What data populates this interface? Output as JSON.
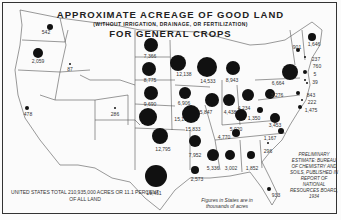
{
  "title": {
    "line1": "APPROXIMATE ACREAGE OF GOOD LAND",
    "line2": "(WITHOUT IRRIGATION, DRAINAGE, OR FERTILIZATION)",
    "line3": "FOR GENERAL CROPS"
  },
  "notes": {
    "total": "UNITED STATES TOTAL 210,935,000 ACRES OR 11.1 PERCENT OF ALL LAND",
    "units": "Figures in States are in thousands of acres",
    "source": "PRELIMINARY ESTIMATE: BUREAU OF CHEMISTRY AND SOILS, PUBLISHED IN REPORT OF NATIONAL RESOURCES BOARD, 1934"
  },
  "states": [
    {
      "name": "Washington",
      "value": "542",
      "x": 50,
      "y": 27,
      "r": 3,
      "lx": 46,
      "ly": 30
    },
    {
      "name": "Oregon",
      "value": "2,059",
      "x": 38,
      "y": 53,
      "r": 5,
      "lx": 38,
      "ly": 59
    },
    {
      "name": "Idaho",
      "value": "87",
      "x": 70,
      "y": 64,
      "r": 1,
      "lx": 70,
      "ly": 67
    },
    {
      "name": "California",
      "value": "478",
      "x": 27,
      "y": 108,
      "r": 2,
      "lx": 28,
      "ly": 112
    },
    {
      "name": "Colorado",
      "value": "286",
      "x": 115,
      "y": 108,
      "r": 1,
      "lx": 115,
      "ly": 112
    },
    {
      "name": "North Dakota",
      "value": "7,366",
      "x": 151,
      "y": 45,
      "r": 7,
      "lx": 150,
      "ly": 54
    },
    {
      "name": "South Dakota",
      "value": "8,775",
      "x": 149,
      "y": 69,
      "r": 7,
      "lx": 150,
      "ly": 78
    },
    {
      "name": "Nebraska",
      "value": "9,690",
      "x": 151,
      "y": 93,
      "r": 7,
      "lx": 150,
      "ly": 102
    },
    {
      "name": "Kansas",
      "value": "15,172",
      "x": 148,
      "y": 117,
      "r": 9,
      "lx": 182,
      "ly": 117
    },
    {
      "name": "Oklahoma",
      "value": "12,795",
      "x": 160,
      "y": 136,
      "r": 8,
      "lx": 163,
      "ly": 147
    },
    {
      "name": "Texas",
      "value": "19,461",
      "x": 156,
      "y": 176,
      "r": 11,
      "lx": 154,
      "ly": 191
    },
    {
      "name": "Minnesota",
      "value": "12,138",
      "x": 178,
      "y": 63,
      "r": 8,
      "lx": 184,
      "ly": 72
    },
    {
      "name": "Wisconsin",
      "value": "14,533",
      "x": 207,
      "y": 67,
      "r": 10,
      "lx": 208,
      "ly": 79
    },
    {
      "name": "Iowa",
      "value": "6,906",
      "x": 185,
      "y": 93,
      "r": 6,
      "lx": 184,
      "ly": 101
    },
    {
      "name": "Missouri",
      "value": "15,833",
      "x": 191,
      "y": 114,
      "r": 9,
      "lx": 193,
      "ly": 127
    },
    {
      "name": "Arkansas",
      "value": "7,952",
      "x": 195,
      "y": 141,
      "r": 6,
      "lx": 195,
      "ly": 153
    },
    {
      "name": "Louisiana",
      "value": "2,573",
      "x": 195,
      "y": 170,
      "r": 4,
      "lx": 197,
      "ly": 177
    },
    {
      "name": "Michigan",
      "value": "8,943",
      "x": 233,
      "y": 68,
      "r": 7,
      "lx": 232,
      "ly": 78
    },
    {
      "name": "Illinois",
      "value": "5,847",
      "x": 212,
      "y": 100,
      "r": 7,
      "lx": 206,
      "ly": 110
    },
    {
      "name": "Indiana",
      "value": "4,438",
      "x": 229,
      "y": 100,
      "r": 6,
      "lx": 230,
      "ly": 110
    },
    {
      "name": "Ohio",
      "value": "4,234",
      "x": 248,
      "y": 95,
      "r": 6,
      "lx": 244,
      "ly": 106
    },
    {
      "name": "Kentucky",
      "value": "5,020",
      "x": 241,
      "y": 115,
      "r": 6,
      "lx": 236,
      "ly": 127
    },
    {
      "name": "Tennessee",
      "value": "4,770",
      "x": 236,
      "y": 133,
      "r": 4,
      "lx": 224,
      "ly": 135
    },
    {
      "name": "Mississippi",
      "value": "5,336",
      "x": 213,
      "y": 155,
      "r": 6,
      "lx": 213,
      "ly": 166
    },
    {
      "name": "Alabama",
      "value": "3,002",
      "x": 230,
      "y": 155,
      "r": 5,
      "lx": 231,
      "ly": 166
    },
    {
      "name": "Georgia",
      "value": "1,852",
      "x": 251,
      "y": 155,
      "r": 4,
      "lx": 252,
      "ly": 166
    },
    {
      "name": "South Carolina",
      "value": "296",
      "x": 268,
      "y": 143,
      "r": 1,
      "lx": 268,
      "ly": 149
    },
    {
      "name": "North Carolina",
      "value": "1,167",
      "x": 281,
      "y": 131,
      "r": 3,
      "lx": 270,
      "ly": 136
    },
    {
      "name": "Florida",
      "value": "933",
      "x": 269,
      "y": 189,
      "r": 2,
      "lx": 276,
      "ly": 193
    },
    {
      "name": "West Virginia",
      "value": "1,350",
      "x": 260,
      "y": 110,
      "r": 3,
      "lx": 254,
      "ly": 116
    },
    {
      "name": "Virginia",
      "value": "3,453",
      "x": 275,
      "y": 118,
      "r": 5,
      "lx": 275,
      "ly": 123
    },
    {
      "name": "Pennsylvania",
      "value": "3,276",
      "x": 270,
      "y": 94,
      "r": 5,
      "lx": 277,
      "ly": 93
    },
    {
      "name": "New York",
      "value": "6,664",
      "x": 290,
      "y": 72,
      "r": 8,
      "lx": 278,
      "ly": 81
    },
    {
      "name": "Maryland",
      "value": "843",
      "x": 298,
      "y": 93,
      "r": 2,
      "lx": 311,
      "ly": 93
    },
    {
      "name": "Delaware",
      "value": "222",
      "x": 302,
      "y": 100,
      "r": 1,
      "lx": 312,
      "ly": 100
    },
    {
      "name": "New Jersey",
      "value": "1,475",
      "x": 300,
      "y": 107,
      "r": 2,
      "lx": 311,
      "ly": 108
    },
    {
      "name": "Vermont",
      "value": "901",
      "x": 298,
      "y": 50,
      "r": 2,
      "lx": 297,
      "ly": 45
    },
    {
      "name": "Maine",
      "value": "1,646",
      "x": 312,
      "y": 37,
      "r": 4,
      "lx": 314,
      "ly": 42
    },
    {
      "name": "New Hampshire",
      "value": "237",
      "x": 305,
      "y": 57,
      "r": 1,
      "lx": 316,
      "ly": 57
    },
    {
      "name": "Massachusetts",
      "value": "760",
      "x": 305,
      "y": 72,
      "r": 2,
      "lx": 317,
      "ly": 64
    },
    {
      "name": "Connecticut",
      "value": "5",
      "x": 305,
      "y": 80,
      "r": 1,
      "lx": 315,
      "ly": 72
    },
    {
      "name": "Rhode Island",
      "value": "39",
      "x": 307,
      "y": 83,
      "r": 1,
      "lx": 315,
      "ly": 80
    }
  ]
}
